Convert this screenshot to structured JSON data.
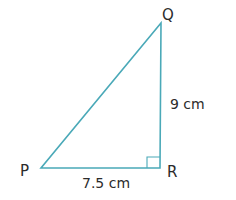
{
  "diagram": {
    "type": "right-triangle",
    "colors": {
      "line": "#4aa9b8",
      "text": "#2b2b2b"
    },
    "vertices": {
      "P": {
        "label": "P",
        "x": 41,
        "y": 168
      },
      "Q": {
        "label": "Q",
        "x": 161,
        "y": 23
      },
      "R": {
        "label": "R",
        "x": 160,
        "y": 168
      }
    },
    "right_angle_at": "R",
    "sides": {
      "PR": {
        "label": "7.5 cm"
      },
      "QR": {
        "label": "9 cm"
      }
    }
  }
}
